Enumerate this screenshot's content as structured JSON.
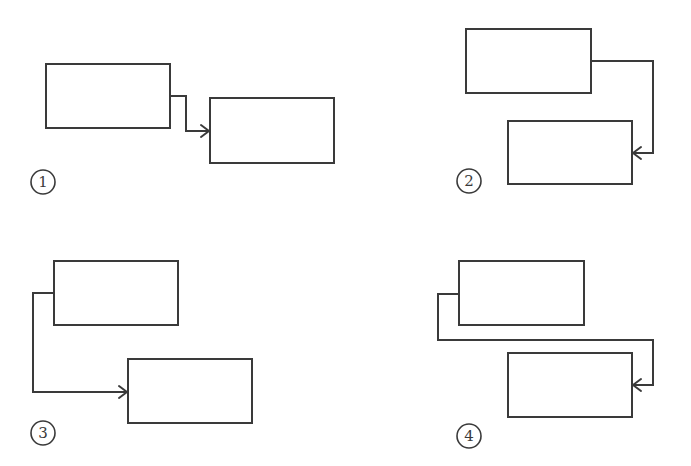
{
  "colors": {
    "stroke": "#3a3a3a",
    "background": "#ffffff"
  },
  "panels": [
    {
      "label": "1",
      "description": "Connector exits right side of first box, steps down, enters left side of second box",
      "box_a": {
        "x": 46,
        "y": 64,
        "w": 124,
        "h": 64
      },
      "box_b": {
        "x": 210,
        "y": 98,
        "w": 124,
        "h": 65
      },
      "connector": "170,96 186,96 186,131 208,131",
      "arrow_tip": {
        "x": 209,
        "y": 131,
        "dir": "right"
      },
      "badge": {
        "cx": 43,
        "cy": 182
      }
    },
    {
      "label": "2",
      "description": "Connector exits right side of first box, goes down, enters right side of second box",
      "box_a": {
        "x": 466,
        "y": 29,
        "w": 125,
        "h": 64
      },
      "box_b": {
        "x": 508,
        "y": 121,
        "w": 124,
        "h": 63
      },
      "connector": "591,61 653,61 653,153 634,153",
      "arrow_tip": {
        "x": 633,
        "y": 153,
        "dir": "left"
      },
      "badge": {
        "cx": 469,
        "cy": 181
      }
    },
    {
      "label": "3",
      "description": "Connector exits left side of first box, goes down, enters left side of second box",
      "box_a": {
        "x": 54,
        "y": 261,
        "w": 124,
        "h": 64
      },
      "box_b": {
        "x": 128,
        "y": 359,
        "w": 124,
        "h": 64
      },
      "connector": "54,293 33,293 33,392 126,392",
      "arrow_tip": {
        "x": 127,
        "y": 392,
        "dir": "right"
      },
      "badge": {
        "cx": 43,
        "cy": 433
      }
    },
    {
      "label": "4",
      "description": "Connector exits left side of first box, wraps below and around, enters right side of second box",
      "box_a": {
        "x": 459,
        "y": 261,
        "w": 125,
        "h": 64
      },
      "box_b": {
        "x": 508,
        "y": 353,
        "w": 124,
        "h": 64
      },
      "connector": "459,294 438,294 438,340 653,340 653,385 634,385",
      "arrow_tip": {
        "x": 633,
        "y": 385,
        "dir": "left"
      },
      "badge": {
        "cx": 469,
        "cy": 436
      }
    }
  ]
}
